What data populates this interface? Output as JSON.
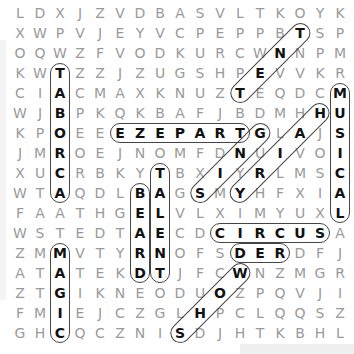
{
  "puzzle": {
    "rows": 17,
    "cols": 17,
    "grid": [
      "LDXJZVDBASVLTKOYK",
      "XWPVJEYVCPEPPBTSP",
      "OQWZFVODKURCWNNPM",
      "KWTZZJZUGSHPEVVKR",
      "CIACMAXKNUZTEQDCM",
      "WJBPKQKBAFJBDMHHU",
      "KPOEEEZEPARTGLAJS",
      "JMROEJNOMFDNUIVOI",
      "XUCRBKYTBXIYRLMSC",
      "WTAQDLBAGSMYHFXIA",
      "FAATHGELVLXIMYUXL",
      "WSTEDTAECDCIRCUSA",
      "ZMMVTYRNOFSDERDFJ",
      "ATATEKDTJFCWNZMGR",
      "ZTGIKNEODUOZPQVJI",
      "FMIEJCZGLHPCLQQSZ",
      "GHCQCZNISDJHTKBHL"
    ],
    "found_words": [
      {
        "word": "TABORCA",
        "start": [
          3,
          2
        ],
        "end": [
          9,
          2
        ],
        "direction": "down"
      },
      {
        "word": "TENT",
        "start": [
          1,
          14
        ],
        "end": [
          4,
          11
        ],
        "direction": "diag-down-left"
      },
      {
        "word": "MUSICAL",
        "start": [
          4,
          16
        ],
        "end": [
          10,
          16
        ],
        "direction": "down"
      },
      {
        "word": "EZEPART",
        "start": [
          6,
          5
        ],
        "end": [
          6,
          11
        ],
        "direction": "right"
      },
      {
        "word": "HAIRY",
        "start": [
          5,
          15
        ],
        "end": [
          9,
          11
        ],
        "direction": "diag-down-left"
      },
      {
        "word": "GNIS",
        "start": [
          6,
          12
        ],
        "end": [
          9,
          9
        ],
        "direction": "diag-down-left"
      },
      {
        "word": "BEARD",
        "start": [
          9,
          6
        ],
        "end": [
          13,
          6
        ],
        "direction": "down"
      },
      {
        "word": "TALENT",
        "start": [
          8,
          7
        ],
        "end": [
          13,
          7
        ],
        "direction": "down"
      },
      {
        "word": "CIRCUS",
        "start": [
          11,
          10
        ],
        "end": [
          11,
          15
        ],
        "direction": "right"
      },
      {
        "word": "DER",
        "start": [
          12,
          11
        ],
        "end": [
          12,
          13
        ],
        "direction": "right"
      },
      {
        "word": "MAGIC",
        "start": [
          12,
          2
        ],
        "end": [
          16,
          2
        ],
        "direction": "down"
      },
      {
        "word": "WOHS",
        "start": [
          13,
          11
        ],
        "end": [
          16,
          8
        ],
        "direction": "diag-down-left"
      }
    ],
    "colors": {
      "letter": "#9a9a9a",
      "found_letter": "#111111",
      "ring": "#444444"
    }
  }
}
